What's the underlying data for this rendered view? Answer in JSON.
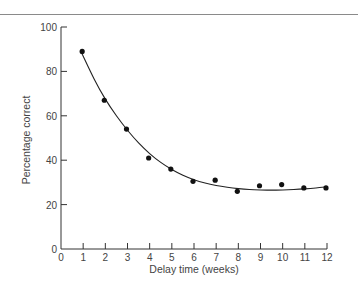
{
  "chart_data": {
    "type": "scatter",
    "title": "",
    "xlabel": "Delay time (weeks)",
    "ylabel": "Percentage correct",
    "xlim": [
      0,
      12
    ],
    "ylim": [
      0,
      100
    ],
    "x_ticks": [
      0,
      1,
      2,
      3,
      4,
      5,
      6,
      7,
      8,
      9,
      10,
      11,
      12
    ],
    "y_ticks": [
      0,
      20,
      40,
      60,
      80,
      100
    ],
    "grid": false,
    "legend": null,
    "series": [
      {
        "name": "Observed",
        "marker": "filled-circle",
        "x": [
          1,
          2,
          3,
          4,
          5,
          6,
          7,
          8,
          9,
          10,
          11,
          12
        ],
        "y": [
          89,
          67,
          54,
          41,
          36,
          30.5,
          31,
          26,
          28.5,
          29,
          27.5,
          27.5
        ]
      },
      {
        "name": "Fitted curve",
        "type": "line",
        "x": [
          0.9,
          1.5,
          2,
          2.5,
          3,
          3.5,
          4,
          4.5,
          5,
          5.5,
          6,
          6.5,
          7,
          7.5,
          8,
          8.5,
          9,
          9.5,
          10,
          10.5,
          11,
          11.5,
          12
        ],
        "y": [
          89,
          76.5,
          67.5,
          60,
          53.5,
          47.8,
          43,
          39,
          35.8,
          33.2,
          31.2,
          29.7,
          28.6,
          27.8,
          27.2,
          26.8,
          26.6,
          26.5,
          26.6,
          26.8,
          27.1,
          27.5,
          28
        ]
      }
    ]
  }
}
